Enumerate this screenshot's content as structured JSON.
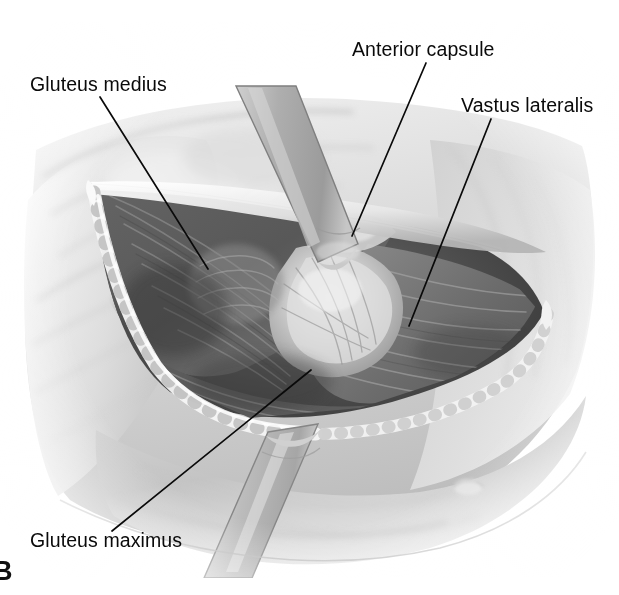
{
  "figure": {
    "panel_letter": "B",
    "medium": "grayscale pencil/airbrush medical illustration",
    "canvas": {
      "width": 619,
      "height": 595
    },
    "background_color": "#ffffff"
  },
  "annotations": [
    {
      "id": "gluteus-medius",
      "label": "Gluteus medius",
      "text_x": 30,
      "text_y": 92,
      "leader": {
        "x1": 100,
        "y1": 97,
        "x2": 208,
        "y2": 269
      },
      "anchor": "left"
    },
    {
      "id": "anterior-capsule",
      "label": "Anterior capsule",
      "text_x": 352,
      "text_y": 57,
      "leader": {
        "x1": 426,
        "y1": 63,
        "x2": 352,
        "y2": 236
      },
      "anchor": "left"
    },
    {
      "id": "vastus-lateralis",
      "label": "Vastus lateralis",
      "text_x": 461,
      "text_y": 113,
      "leader": {
        "x1": 491,
        "y1": 119,
        "x2": 409,
        "y2": 326
      },
      "anchor": "left"
    },
    {
      "id": "gluteus-maximus",
      "label": "Gluteus maximus",
      "text_x": 30,
      "text_y": 548,
      "leader": {
        "x1": 112,
        "y1": 531,
        "x2": 311,
        "y2": 370
      },
      "anchor": "left"
    }
  ],
  "colors": {
    "leader_line": "#0a0a0a",
    "label_text": "#0a0a0a",
    "panel_letter": "#111111",
    "skin_light": "#e8e8e8",
    "skin_mid": "#c9c9c9",
    "skin_shadow": "#9d9d9d",
    "fascia_edge": "#f4f4f4",
    "wound_deep": "#4a4a4a",
    "wound_darkest": "#343434",
    "muscle_mid": "#7d7d7d",
    "muscle_light": "#b4b4b4",
    "capsule_highlight": "#dcdcdc",
    "retractor_fill": "#b0b0b0",
    "retractor_edge": "#8a8a8a",
    "retractor_highlight": "#d8d8d8"
  },
  "structures": [
    {
      "name": "gluteus-medius-muscle",
      "role": "muscle belly, upper-left of wound"
    },
    {
      "name": "gluteus-maximus-muscle",
      "role": "muscle belly, lower border of wound"
    },
    {
      "name": "vastus-lateralis-muscle",
      "role": "muscle belly, right of wound"
    },
    {
      "name": "anterior-hip-capsule",
      "role": "joint capsule, center of wound"
    },
    {
      "name": "retractor-superior",
      "role": "retractor blade crossing upper wound"
    },
    {
      "name": "retractor-inferior",
      "role": "retractor blade crossing lower wound"
    },
    {
      "name": "skin-incision-edge",
      "role": "everted skin/fascia wound margin"
    },
    {
      "name": "thigh-skin-surface",
      "role": "surrounding intact skin and soft tissue"
    }
  ]
}
